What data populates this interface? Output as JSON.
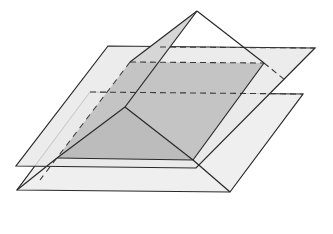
{
  "figure": {
    "colors": {
      "background": "#ffffff",
      "plane_fill": "#ececec",
      "face_fill": "#dcdcdc",
      "section_fill": "#bdbdbd",
      "stroke": "#2a2a2a",
      "dashed": "#3a3a3a"
    },
    "apex": [
      197,
      11
    ],
    "upper_plane": [
      [
        108,
        46
      ],
      [
        315,
        48
      ],
      [
        196,
        168
      ],
      [
        16,
        166
      ]
    ],
    "lower_plane": [
      [
        303,
        94
      ],
      [
        230,
        192
      ],
      [
        17,
        190
      ],
      [
        90,
        92
      ]
    ],
    "upper_section": [
      [
        130,
        62
      ],
      [
        264,
        63
      ],
      [
        193,
        160
      ],
      [
        57,
        158
      ]
    ],
    "inner_vertex": [
      125,
      107
    ]
  }
}
